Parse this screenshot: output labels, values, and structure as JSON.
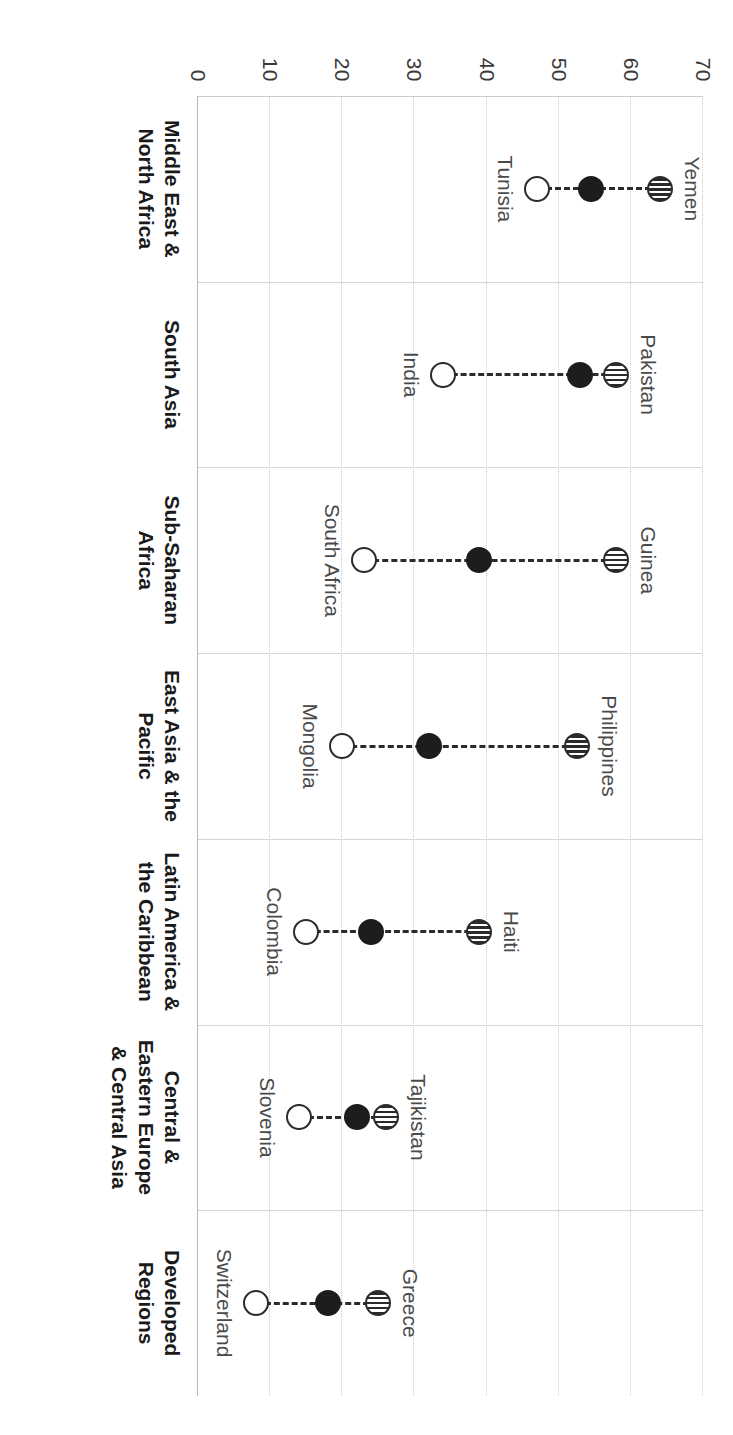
{
  "chart_data": {
    "type": "scatter",
    "subtype": "dumbbell-range-plot",
    "title": "",
    "xlabel": "",
    "ylabel": "",
    "ylim": [
      0,
      70
    ],
    "yticks": [
      0,
      10,
      20,
      30,
      40,
      50,
      60,
      70
    ],
    "grid": true,
    "legend": "none",
    "categories": [
      "Middle East & North Africa",
      "South Asia",
      "Sub-Saharan Africa",
      "East Asia & the Pacific",
      "Latin America & the Caribbean",
      "Central & Eastern Europe & Central Asia",
      "Developed Regions"
    ],
    "series": [
      {
        "name": "highest-country",
        "marker": "striped-circle",
        "values": [
          64,
          58,
          58,
          52.5,
          39,
          26,
          25
        ],
        "point_labels": [
          "Yemen",
          "Pakistan",
          "Guinea",
          "Philippines",
          "Haiti",
          "Tajikistan",
          "Greece"
        ]
      },
      {
        "name": "regional-average",
        "marker": "filled-circle",
        "values": [
          54.5,
          53,
          39,
          32,
          24,
          22,
          18
        ],
        "point_labels": [
          "",
          "",
          "",
          "",
          "",
          "",
          ""
        ]
      },
      {
        "name": "lowest-country",
        "marker": "hollow-circle",
        "values": [
          47,
          34,
          23,
          20,
          15,
          14,
          8
        ],
        "point_labels": [
          "Tunisia",
          "India",
          "South Africa",
          "Mongolia",
          "Colombia",
          "Slovenia",
          "Switzerland"
        ]
      }
    ],
    "points": [
      {
        "category": "Middle East & North Africa",
        "high_label": "Yemen",
        "high": 64,
        "mid": 54.5,
        "low_label": "Tunisia",
        "low": 47
      },
      {
        "category": "South Asia",
        "high_label": "Pakistan",
        "high": 58,
        "mid": 53,
        "low_label": "India",
        "low": 34
      },
      {
        "category": "Sub-Saharan Africa",
        "high_label": "Guinea",
        "high": 58,
        "mid": 39,
        "low_label": "South Africa",
        "low": 23
      },
      {
        "category": "East Asia & the Pacific",
        "high_label": "Philippines",
        "high": 52.5,
        "mid": 32,
        "low_label": "Mongolia",
        "low": 20
      },
      {
        "category": "Latin America & the Caribbean",
        "high_label": "Haiti",
        "high": 39,
        "mid": 24,
        "low_label": "Colombia",
        "low": 15
      },
      {
        "category": "Central & Eastern Europe & Central Asia",
        "high_label": "Tajikistan",
        "high": 26,
        "mid": 22,
        "low_label": "Slovenia",
        "low": 14
      },
      {
        "category": "Developed Regions",
        "high_label": "Greece",
        "high": 25,
        "mid": 18,
        "low_label": "Switzerland",
        "low": 8
      }
    ]
  },
  "colors": {
    "ink": "#1d1d1d",
    "grid": "#c9c9c9",
    "axis": "#b8b8b8",
    "label": "#4a4a4a"
  }
}
